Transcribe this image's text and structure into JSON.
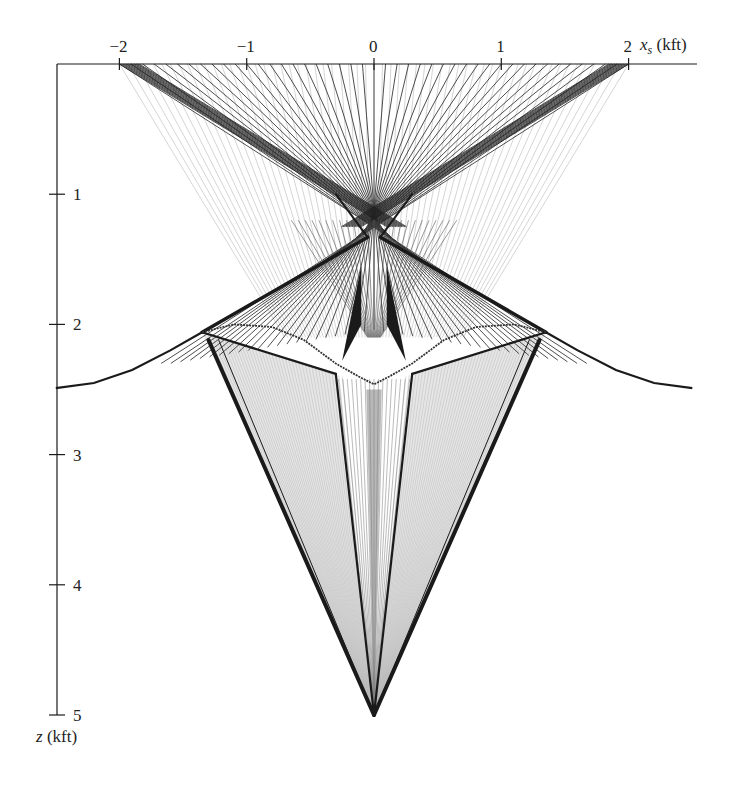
{
  "figure": {
    "type": "ray-tracing diagram",
    "x_axis": {
      "label_var": "x",
      "label_sub": "s",
      "label_unit": "(kft)",
      "ticks": [
        {
          "value": -2,
          "label": "−2"
        },
        {
          "value": -1,
          "label": "−1"
        },
        {
          "value": 0,
          "label": "0"
        },
        {
          "value": 1,
          "label": "1"
        },
        {
          "value": 2,
          "label": "2"
        }
      ],
      "range": [
        -2.5,
        2.5
      ],
      "position": "top"
    },
    "z_axis": {
      "label_var": "z",
      "label_unit": "(kft)",
      "ticks": [
        {
          "value": 1,
          "label": "1"
        },
        {
          "value": 2,
          "label": "2"
        },
        {
          "value": 3,
          "label": "3"
        },
        {
          "value": 4,
          "label": "4"
        },
        {
          "value": 5,
          "label": "5"
        }
      ],
      "range": [
        0,
        5
      ],
      "direction": "down"
    },
    "source_span": [
      -2,
      2
    ],
    "focus_point": {
      "x": 0,
      "z": 5
    },
    "interface_curve": [
      [
        -2.5,
        2.49
      ],
      [
        -2.2,
        2.45
      ],
      [
        -1.9,
        2.35
      ],
      [
        -1.6,
        2.2
      ],
      [
        -1.35,
        2.06
      ]
    ],
    "inner_curve": [
      [
        -1.35,
        2.06
      ],
      [
        -1.1,
        2.0
      ],
      [
        -0.8,
        2.02
      ],
      [
        -0.55,
        2.12
      ],
      [
        -0.3,
        2.3
      ],
      [
        -0.12,
        2.4
      ],
      [
        0,
        2.46
      ]
    ],
    "colors": {
      "ink": "#1a1a1a",
      "ray_dark": "#3a3a3a",
      "ray_light": "#b8b8b8",
      "fill_light": "#e6e6e6",
      "fill_mid": "#9a9a9a"
    }
  }
}
